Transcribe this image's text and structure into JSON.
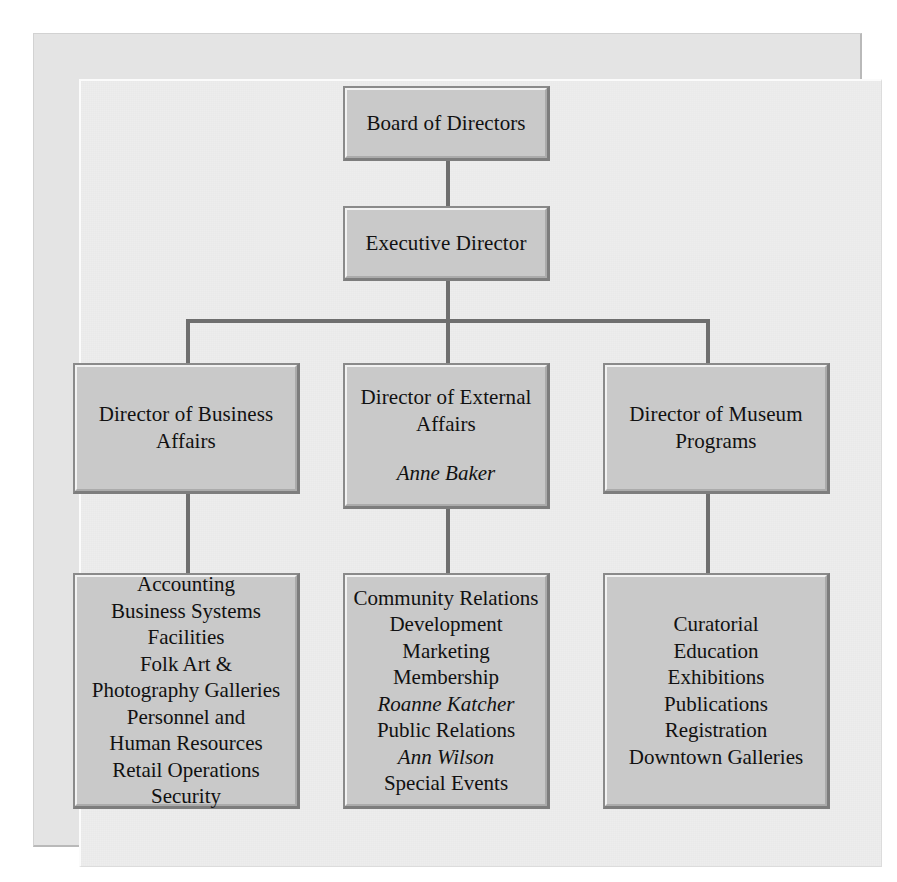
{
  "chart": {
    "type": "org-chart",
    "colors": {
      "page_background": "#ffffff",
      "frame_background": "#ededed",
      "box_fill": "#c9c9c9",
      "box_border": "#8a8a8a",
      "connector": "#6e6e6e",
      "text": "#111111"
    },
    "levels": 4
  },
  "nodes": {
    "board": {
      "label": "Board of Directors"
    },
    "executive": {
      "label": "Executive Director"
    },
    "business_affairs": {
      "line1": "Director of Business",
      "line2": "Affairs"
    },
    "external_affairs": {
      "line1": "Director of External",
      "line2": "Affairs",
      "person": "Anne Baker"
    },
    "museum_programs": {
      "line1": "Director of Museum",
      "line2": "Programs"
    }
  },
  "departments": {
    "business_affairs": [
      {
        "name": "Accounting",
        "italic": false
      },
      {
        "name": "Business Systems",
        "italic": false
      },
      {
        "name": "Facilities",
        "italic": false
      },
      {
        "name": "Folk Art &",
        "italic": false
      },
      {
        "name": "Photography Galleries",
        "italic": false
      },
      {
        "name": "Personnel and",
        "italic": false
      },
      {
        "name": "Human Resources",
        "italic": false
      },
      {
        "name": "Retail Operations",
        "italic": false
      },
      {
        "name": "Security",
        "italic": false
      }
    ],
    "external_affairs": [
      {
        "name": "Community Relations",
        "italic": false
      },
      {
        "name": "Development",
        "italic": false
      },
      {
        "name": "Marketing",
        "italic": false
      },
      {
        "name": "Membership",
        "italic": false
      },
      {
        "name": "Roanne Katcher",
        "italic": true
      },
      {
        "name": "Public Relations",
        "italic": false
      },
      {
        "name": "Ann Wilson",
        "italic": true
      },
      {
        "name": "Special Events",
        "italic": false
      }
    ],
    "museum_programs": [
      {
        "name": "Curatorial",
        "italic": false
      },
      {
        "name": "Education",
        "italic": false
      },
      {
        "name": "Exhibitions",
        "italic": false
      },
      {
        "name": "Publications",
        "italic": false
      },
      {
        "name": "Registration",
        "italic": false
      },
      {
        "name": "Downtown Galleries",
        "italic": false
      }
    ]
  }
}
